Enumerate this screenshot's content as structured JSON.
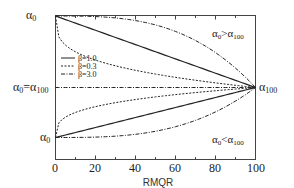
{
  "chart_data": {
    "type": "line",
    "title": "",
    "xlabel": "RMQR",
    "ylabel": "",
    "xlim": [
      0,
      100
    ],
    "x_ticks": [
      0,
      20,
      40,
      60,
      80,
      100
    ],
    "x_minor_ticks": [
      10,
      30,
      50,
      70,
      90
    ],
    "grid": false,
    "legend_position": "left, inside plot",
    "model": "alpha(x) = alpha_0 + (alpha_100 - alpha_0) * (x/100)^beta",
    "y_levels": {
      "top": "α0",
      "middle": "α0=α100",
      "bottom": "α0",
      "convergence": "α100"
    },
    "legend": [
      {
        "label": "β=1.0",
        "style": "solid"
      },
      {
        "label": "β=0.3",
        "style": "dashed"
      },
      {
        "label": "β=3.0",
        "style": "dash-dot"
      }
    ],
    "regions": [
      {
        "label": "α0>α100",
        "position": "upper-right"
      },
      {
        "label": "α0<α100",
        "position": "lower-right"
      }
    ],
    "series": [
      {
        "name": "β=1.0",
        "case": "α0>α100",
        "beta": 1.0,
        "style": "solid",
        "x": [
          0,
          100
        ],
        "y_rel": [
          1,
          0
        ]
      },
      {
        "name": "β=0.3",
        "case": "α0>α100",
        "beta": 0.3,
        "style": "dashed",
        "x": [
          0,
          100
        ],
        "y_rel": [
          1,
          0
        ]
      },
      {
        "name": "β=3.0",
        "case": "α0>α100",
        "beta": 3.0,
        "style": "dash-dot",
        "x": [
          0,
          100
        ],
        "y_rel": [
          1,
          0
        ]
      },
      {
        "name": "α0=α100",
        "case": "α0=α100",
        "beta": null,
        "style": "dash-dot",
        "x": [
          0,
          100
        ],
        "y_rel": [
          0,
          0
        ]
      },
      {
        "name": "β=1.0",
        "case": "α0<α100",
        "beta": 1.0,
        "style": "solid",
        "x": [
          0,
          100
        ],
        "y_rel": [
          -1,
          0
        ]
      },
      {
        "name": "β=0.3",
        "case": "α0<α100",
        "beta": 0.3,
        "style": "dashed",
        "x": [
          0,
          100
        ],
        "y_rel": [
          -1,
          0
        ]
      },
      {
        "name": "β=3.0",
        "case": "α0<α100",
        "beta": 3.0,
        "style": "dash-dot",
        "x": [
          0,
          100
        ],
        "y_rel": [
          -1,
          0
        ]
      }
    ]
  },
  "labels": {
    "y_top": "α",
    "y_top_sub": "0",
    "y_mid_a": "α",
    "y_mid_a_sub": "0",
    "y_mid_eq": "=",
    "y_mid_b": "α",
    "y_mid_b_sub": "100",
    "y_bottom": "α",
    "y_bottom_sub": "0",
    "right_label": "α",
    "right_label_sub": "100",
    "region_upper_a": "α",
    "region_upper_a_sub": "0",
    "region_upper_op": ">",
    "region_upper_b": "α",
    "region_upper_b_sub": "100",
    "region_lower_a": "α",
    "region_lower_a_sub": "0",
    "region_lower_op": "<",
    "region_lower_b": "α",
    "region_lower_b_sub": "100",
    "tick_0": "0",
    "tick_20": "20",
    "tick_40": "40",
    "tick_60": "60",
    "tick_80": "80",
    "tick_100": "100",
    "xlabel": "RMQR",
    "legend_1": "β=1.0",
    "legend_2": "β=0.3",
    "legend_3": "β=3.0"
  }
}
